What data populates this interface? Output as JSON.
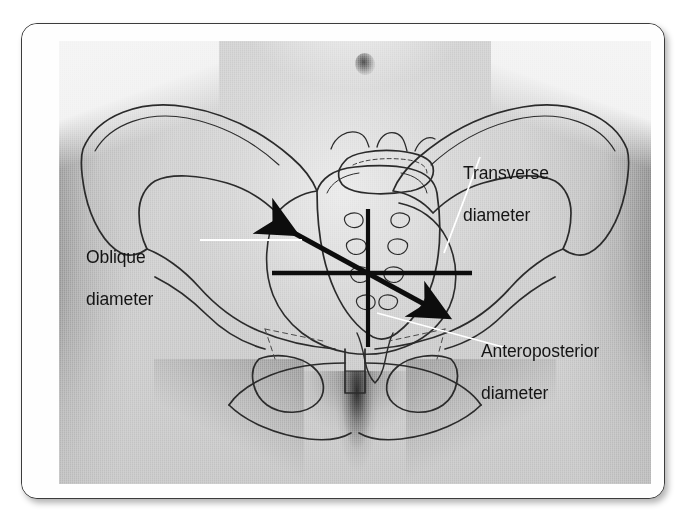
{
  "figure": {
    "domain": "anatomy-illustration",
    "frame": {
      "border_color": "#3c3c3c",
      "matte_color": "#fefefe",
      "corner_radius_px": 16,
      "shadow": true
    },
    "photo": {
      "type": "grayscale-photograph",
      "content": "anterior view of female lower abdomen and hips with line-drawing overlay of the bony pelvis",
      "base_tone": "#cfcfcf"
    },
    "overlay_line_color": "#101010",
    "leader_line_color": "#ffffff",
    "bone_outline_color": "#2a2a2a"
  },
  "labels": [
    {
      "id": "transverse",
      "text": "Transverse\ndiameter",
      "line1": "Transverse",
      "line2": "diameter",
      "leader": "white diagonal leader from label to right pelvic brim"
    },
    {
      "id": "oblique",
      "text": "Oblique\ndiameter",
      "line1": "Oblique",
      "line2": "diameter",
      "leader": "white horizontal leader from label to upper-left arrowhead"
    },
    {
      "id": "anteroposterior",
      "text": "Anteroposterior\ndiameter",
      "line1": "Anteroposterior",
      "line2": "diameter",
      "leader": "white diagonal leader from label up-left toward the sacral promontory"
    }
  ],
  "measurement_lines": [
    {
      "name": "anteroposterior-diameter-line",
      "style": "plain vertical line",
      "orientation": "vertical",
      "arrowheads": 0
    },
    {
      "name": "transverse-diameter-line",
      "style": "plain horizontal line",
      "orientation": "horizontal",
      "arrowheads": 0
    },
    {
      "name": "oblique-diameter-line",
      "style": "thick double-headed diagonal arrow",
      "orientation": "diagonal (upper-left to lower-right)",
      "arrowheads": 2
    }
  ]
}
